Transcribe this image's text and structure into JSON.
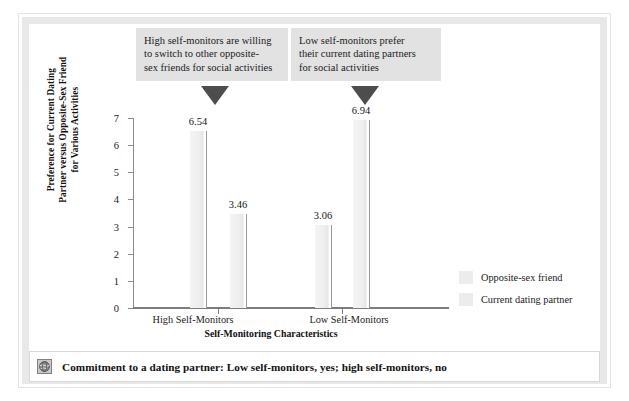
{
  "chart_data": {
    "type": "bar",
    "title": "",
    "xlabel": "Self-Monitoring Characteristics",
    "ylabel": "Preference for Current Dating Partner versus Opposite-Sex Friend for Various Activities",
    "categories": [
      "High Self-Monitors",
      "Low Self-Monitors"
    ],
    "series": [
      {
        "name": "Opposite-sex friend",
        "values": [
          6.54,
          3.06
        ]
      },
      {
        "name": "Current dating partner",
        "values": [
          3.46,
          6.94
        ]
      }
    ],
    "ylim": [
      0,
      7
    ],
    "yticks": [
      "0",
      "1",
      "2",
      "3",
      "4",
      "5",
      "6",
      "7"
    ],
    "grid": false,
    "legend_position": "right",
    "annotations": [
      "High self-monitors are willing to switch to other opposite-sex friends for social activities",
      "Low self-monitors prefer their current dating partners for social activities"
    ],
    "bar_labels": [
      "6.54",
      "3.46",
      "3.06",
      "6.94"
    ]
  },
  "axis": {
    "y_title_lines": [
      "Preference for Current Dating",
      "Partner versus Opposite-Sex Friend",
      "for Various Activities"
    ],
    "x_title": "Self-Monitoring Characteristics",
    "y_ticks": [
      "7",
      "6",
      "5",
      "4",
      "3",
      "2",
      "1",
      "0"
    ],
    "category_labels": [
      "High Self-Monitors",
      "Low Self-Monitors"
    ]
  },
  "callouts": {
    "high": {
      "lines": [
        "High self-monitors are willing",
        "to switch to other opposite-",
        "sex friends for social activities"
      ]
    },
    "low": {
      "lines": [
        "Low self-monitors prefer",
        "their current dating partners",
        "for social activities"
      ]
    }
  },
  "legend": {
    "items": [
      {
        "label": "Opposite-sex friend",
        "color": "#ececec"
      },
      {
        "label": "Current dating partner",
        "color": "#ececec"
      }
    ]
  },
  "caption": {
    "icon": "globe-icon",
    "text": "Commitment to a dating partner: Low self-monitors, yes; high self-monitors, no"
  },
  "bars": [
    {
      "value": "6.54",
      "group": "High Self-Monitors",
      "series": "Opposite-sex friend"
    },
    {
      "value": "3.46",
      "group": "High Self-Monitors",
      "series": "Current dating partner"
    },
    {
      "value": "3.06",
      "group": "Low Self-Monitors",
      "series": "Opposite-sex friend"
    },
    {
      "value": "6.94",
      "group": "Low Self-Monitors",
      "series": "Current dating partner"
    }
  ],
  "colors": {
    "bar_fill": "#efefef",
    "bar_edge": "#9a9a9a",
    "callout_bg": "#e2e2e2",
    "arrow": "#4d4d4d",
    "axis": "#7d7d7d",
    "frame": "#e8e8e8"
  }
}
